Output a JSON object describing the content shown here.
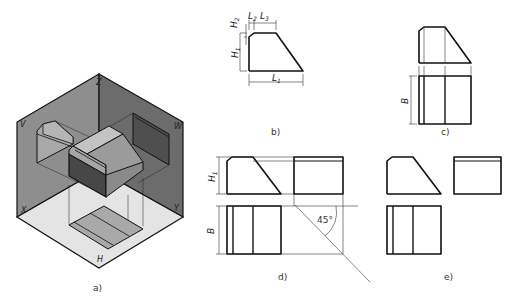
{
  "figure": {
    "panels": [
      {
        "id": "a",
        "label": "a)",
        "description": "isometric view of object projected onto three planes"
      },
      {
        "id": "b",
        "label": "b)",
        "description": "front view with dimensions"
      },
      {
        "id": "c",
        "label": "c)",
        "description": "front and top views"
      },
      {
        "id": "d",
        "label": "d)",
        "description": "three views with 45° construction line"
      },
      {
        "id": "e",
        "label": "e)",
        "description": "final three-view drawing"
      }
    ],
    "planes": {
      "V": "V",
      "W": "W",
      "H": "H",
      "X": "X",
      "Y": "Y",
      "Z": "Z"
    },
    "dimensions": {
      "L1": "L",
      "L1_sub": "1",
      "L2": "L",
      "L2_sub": "2",
      "L3": "L",
      "L3_sub": "3",
      "H1": "H",
      "H1_sub": "1",
      "H2": "H",
      "H2_sub": "2",
      "B": "B"
    },
    "angle_label": "45°",
    "colors": {
      "wall_left": "#8c8c8c",
      "wall_right": "#6e6e6e",
      "floor": "#e2e2e2",
      "face_dark": "#4a4a4a",
      "face_mid": "#9a9a9a",
      "face_light": "#bdbdbd",
      "line": "#111111"
    }
  }
}
